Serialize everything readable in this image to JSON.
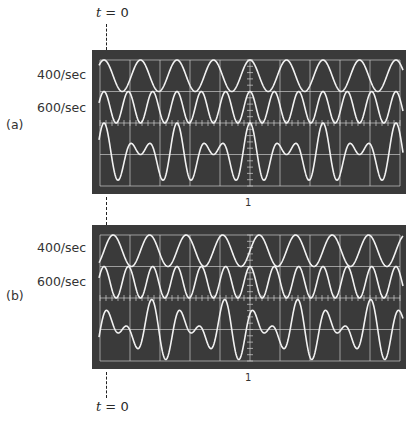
{
  "figure": {
    "time_zero_label_top": "t = 0",
    "time_zero_label_bottom": "t = 0",
    "panels": [
      {
        "id": "a",
        "label": "(a)",
        "channel_labels": [
          "400/sec",
          "600/sec"
        ],
        "center_marker_label": "1",
        "traces": [
          {
            "name": "400/sec",
            "frequency_hz": 400,
            "phase": "cosine (peak at center)"
          },
          {
            "name": "600/sec",
            "frequency_hz": 600,
            "phase": "cosine (peak at center)"
          },
          {
            "name": "sum",
            "components": [
              "400/sec",
              "600/sec"
            ],
            "phase": "both cosine"
          }
        ]
      },
      {
        "id": "b",
        "label": "(b)",
        "channel_labels": [
          "400/sec",
          "600/sec"
        ],
        "center_marker_label": "1",
        "traces": [
          {
            "name": "400/sec",
            "frequency_hz": 400,
            "phase": "sine (rising zero crossing at center)"
          },
          {
            "name": "600/sec",
            "frequency_hz": 600,
            "phase": "cosine (peak at center)"
          },
          {
            "name": "sum",
            "components": [
              "400/sec",
              "600/sec"
            ],
            "phase": "mixed"
          }
        ]
      }
    ],
    "colors": {
      "screen": "#3a3a3a",
      "graticule": "#cfcfcf",
      "trace": "#f2f2f2",
      "text": "#2a2a2a"
    }
  }
}
